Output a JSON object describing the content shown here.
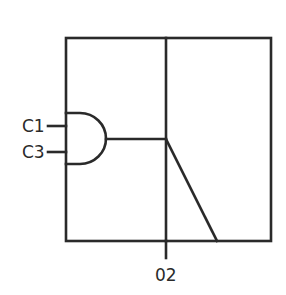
{
  "diagram": {
    "type": "logic-symbol",
    "stroke_color": "#2a2a2a",
    "background": "#ffffff",
    "inputs": [
      {
        "label": "C1"
      },
      {
        "label": "C3"
      }
    ],
    "output": {
      "label": "02"
    },
    "gate": {
      "kind": "AND"
    }
  }
}
